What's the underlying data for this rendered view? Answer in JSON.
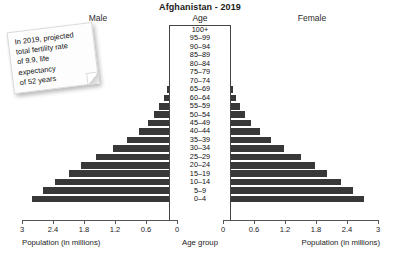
{
  "chart_data": {
    "type": "bar",
    "subtype": "population-pyramid",
    "title": "Afghanistan - 2019",
    "age_axis_title": "Age",
    "left_series_label": "Male",
    "right_series_label": "Female",
    "xlabel_left": "Population (in millions)",
    "xlabel_center": "Age group",
    "xlabel_right": "Population (in millions)",
    "ylabel": "Age group",
    "xlim": [
      0,
      3
    ],
    "grid": false,
    "legend_position": "top",
    "bar_color": "#383838",
    "tick_values": [
      3,
      2.4,
      1.8,
      1.2,
      0.6,
      0
    ],
    "tick_labels_left": [
      "3",
      "2.4",
      "1.8",
      "1.2",
      "0.6",
      "0"
    ],
    "tick_labels_right": [
      "0",
      "0.6",
      "1.2",
      "1.8",
      "2.4",
      "3"
    ],
    "categories": [
      "100+",
      "95–99",
      "90–94",
      "85–89",
      "80–84",
      "75–79",
      "70–74",
      "65–69",
      "60–64",
      "55–59",
      "50–54",
      "45–49",
      "40–44",
      "35–39",
      "30–34",
      "25–29",
      "20–24",
      "15–19",
      "10–14",
      "5–9",
      "0–4"
    ],
    "series": [
      {
        "name": "Male",
        "side": "left",
        "values": [
          0.002,
          0.005,
          0.012,
          0.025,
          0.055,
          0.085,
          0.13,
          0.19,
          0.26,
          0.34,
          0.44,
          0.57,
          0.74,
          0.96,
          1.24,
          1.57,
          1.85,
          2.1,
          2.37,
          2.6,
          2.8
        ]
      },
      {
        "name": "Female",
        "side": "right",
        "values": [
          0.002,
          0.005,
          0.012,
          0.025,
          0.055,
          0.085,
          0.13,
          0.185,
          0.255,
          0.33,
          0.425,
          0.55,
          0.71,
          0.92,
          1.19,
          1.5,
          1.78,
          2.02,
          2.28,
          2.51,
          2.72
        ]
      }
    ]
  },
  "annotation": {
    "name": "sticky-note",
    "text": "In 2019, projected\ntotal fertility rate\nof 9.9, life\nexpectancy\nof 52 years"
  }
}
